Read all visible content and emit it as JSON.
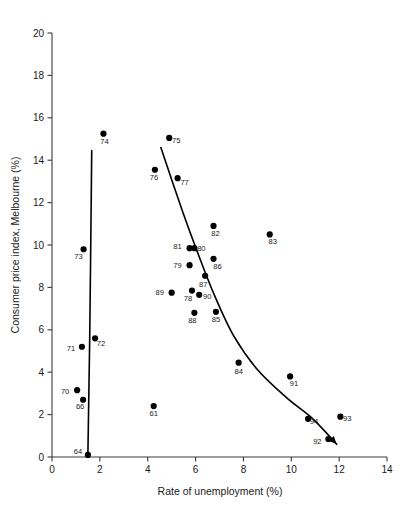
{
  "chart_data": {
    "type": "scatter",
    "title": "",
    "xlabel": "Rate of unemployment (%)",
    "ylabel": "Consumer price index, Melbourne (%)",
    "xlim": [
      0,
      14
    ],
    "ylim": [
      0,
      20
    ],
    "xticks": [
      "0",
      "2",
      "4",
      "6",
      "8",
      "10",
      "12",
      "14"
    ],
    "xtick_values": [
      0,
      2,
      4,
      6,
      8,
      10,
      12,
      14
    ],
    "yticks": [
      "0",
      "2",
      "4",
      "6",
      "8",
      "10",
      "12",
      "14",
      "16",
      "18",
      "20"
    ],
    "ytick_values": [
      0,
      2,
      4,
      6,
      8,
      10,
      12,
      14,
      16,
      18,
      20
    ],
    "grid": false,
    "legend": null,
    "marker": "filled-circle",
    "marker_color": "#000000",
    "points": [
      {
        "label": "64",
        "x": 1.5,
        "y": 0.1,
        "lx": -10,
        "ly": -1
      },
      {
        "label": "66",
        "x": 1.3,
        "y": 2.7,
        "lx": -3,
        "ly": 9
      },
      {
        "label": "70",
        "x": 1.05,
        "y": 3.15,
        "lx": -12,
        "ly": 4
      },
      {
        "label": "71",
        "x": 1.25,
        "y": 5.2,
        "lx": -11,
        "ly": 4
      },
      {
        "label": "72",
        "x": 1.8,
        "y": 5.6,
        "lx": 6,
        "ly": 8
      },
      {
        "label": "73",
        "x": 1.32,
        "y": 9.8,
        "lx": -5,
        "ly": 10
      },
      {
        "label": "74",
        "x": 2.15,
        "y": 15.25,
        "lx": 1,
        "ly": 10
      },
      {
        "label": "61",
        "x": 4.25,
        "y": 2.4,
        "lx": 0,
        "ly": 10
      },
      {
        "label": "76",
        "x": 4.3,
        "y": 13.55,
        "lx": -1,
        "ly": 10
      },
      {
        "label": "75",
        "x": 4.9,
        "y": 15.05,
        "lx": 7,
        "ly": 5
      },
      {
        "label": "77",
        "x": 5.25,
        "y": 13.15,
        "lx": 7,
        "ly": 7
      },
      {
        "label": "89",
        "x": 5.0,
        "y": 7.75,
        "lx": -12,
        "ly": 2
      },
      {
        "label": "79",
        "x": 5.75,
        "y": 9.05,
        "lx": -12,
        "ly": 3
      },
      {
        "label": "81",
        "x": 5.75,
        "y": 9.85,
        "lx": -12,
        "ly": 1
      },
      {
        "label": "80",
        "x": 5.95,
        "y": 9.85,
        "lx": 7,
        "ly": 3
      },
      {
        "label": "78",
        "x": 5.85,
        "y": 7.85,
        "lx": -4,
        "ly": 10
      },
      {
        "label": "88",
        "x": 5.95,
        "y": 6.8,
        "lx": -2,
        "ly": 10
      },
      {
        "label": "90",
        "x": 6.15,
        "y": 7.65,
        "lx": 8,
        "ly": 4
      },
      {
        "label": "87",
        "x": 6.4,
        "y": 8.55,
        "lx": -2,
        "ly": 11
      },
      {
        "label": "86",
        "x": 6.75,
        "y": 9.35,
        "lx": 4,
        "ly": 10
      },
      {
        "label": "82",
        "x": 6.75,
        "y": 10.9,
        "lx": 2,
        "ly": 10
      },
      {
        "label": "85",
        "x": 6.85,
        "y": 6.85,
        "lx": 0,
        "ly": 10
      },
      {
        "label": "84",
        "x": 7.8,
        "y": 4.45,
        "lx": 0,
        "ly": 11
      },
      {
        "label": "83",
        "x": 9.1,
        "y": 10.5,
        "lx": 3,
        "ly": 10
      },
      {
        "label": "91",
        "x": 9.95,
        "y": 3.8,
        "lx": 4,
        "ly": 10
      },
      {
        "label": "94",
        "x": 10.7,
        "y": 1.8,
        "lx": 6,
        "ly": 5
      },
      {
        "label": "92",
        "x": 11.55,
        "y": 0.85,
        "lx": -11,
        "ly": 5
      },
      {
        "label": "93",
        "x": 12.05,
        "y": 1.9,
        "lx": 7,
        "ly": 4
      }
    ],
    "curves": [
      {
        "name": "vertical-trend-line",
        "points": [
          [
            1.5,
            0.1
          ],
          [
            1.58,
            6.0
          ],
          [
            1.66,
            14.45
          ]
        ],
        "arrow": false
      },
      {
        "name": "phillips-curve",
        "points": [
          [
            4.55,
            14.6
          ],
          [
            5.45,
            11.6
          ],
          [
            6.1,
            9.6
          ],
          [
            6.8,
            7.6
          ],
          [
            7.6,
            5.7
          ],
          [
            8.6,
            4.1
          ],
          [
            9.8,
            2.8
          ],
          [
            10.9,
            1.8
          ],
          [
            11.9,
            0.6
          ]
        ],
        "arrow": true
      }
    ]
  }
}
